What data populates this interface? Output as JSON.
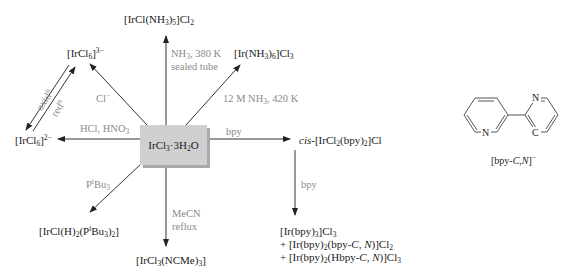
{
  "diagram": {
    "center": {
      "label": "IrCl3·3H2O"
    },
    "products": {
      "ammine_chloro": "[IrCl(NH3)5]Cl2",
      "hexaammine": "[Ir(NH3)6]Cl3",
      "hexachloro_3minus": "[IrCl6]3−",
      "hexachloro_2minus": "[IrCl6]2−",
      "cis_bpy": "cis-[IrCl2(bpy)2]Cl",
      "hydrido_phosphine": "[IrCl(H)2(PtBu3)2]",
      "acetonitrile": "[IrCl3(NCMe)3]",
      "bpy_products": [
        "[Ir(bpy)3]Cl3",
        "+ [Ir(bpy)2(bpy-C, N)]Cl2",
        "+ [Ir(bpy)2(Hbpy-C, N)]Cl3"
      ]
    },
    "conditions": {
      "to_ammine_chloro": [
        "NH3, 380 K",
        "sealed tube"
      ],
      "to_hexaammine": "12 M NH3, 420 K",
      "to_hexachloro_3minus": "Cl−",
      "to_hexachloro_2minus": "HCl, HNO3",
      "oxidation": "oxidn",
      "reduction": "redn",
      "to_cis_bpy": "bpy",
      "cis_to_bpy_products": "bpy",
      "to_hydrido_phosphine": "PtBu3",
      "to_acetonitrile": [
        "MeCN",
        "reflux"
      ]
    },
    "ligand_structure": {
      "caption": "[bpy-C,N]−",
      "atom_labels": [
        "N",
        "N",
        "C"
      ]
    },
    "colors": {
      "text": "#1a1a1a",
      "condition_text": "#8a8a8a",
      "box_fill": "#cfcfcf",
      "box_shadow": "#a9a9a9",
      "arrow": "#333333"
    }
  }
}
